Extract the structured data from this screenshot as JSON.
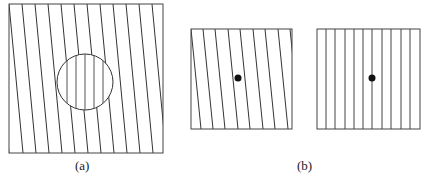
{
  "panels": {
    "a": {
      "label": "(a)",
      "box": {
        "x": 9,
        "y": 4,
        "w": 154,
        "h": 149
      },
      "tilted_line_count": 13,
      "line_tilt_dx": 14,
      "circle": {
        "cx": 85,
        "cy": 82,
        "r": 28,
        "inner_lines": "vertical"
      }
    },
    "b": {
      "label": "(b)",
      "left_box": {
        "x": 191,
        "y": 29,
        "w": 101,
        "h": 100,
        "lines": "tilted",
        "dot": {
          "cx": 238,
          "cy": 78
        }
      },
      "right_box": {
        "x": 317,
        "y": 29,
        "w": 103,
        "h": 100,
        "lines": "vertical",
        "dot": {
          "cx": 372,
          "cy": 78
        }
      }
    }
  },
  "colors": {
    "stroke": "#333333",
    "dot": "#111111"
  }
}
